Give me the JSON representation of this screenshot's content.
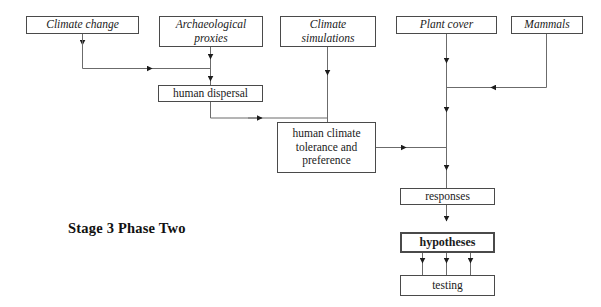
{
  "diagram": {
    "title_label": "Stage 3 Phase Two",
    "nodes": [
      {
        "id": "climate_change",
        "label": "Climate change"
      },
      {
        "id": "arch_proxies",
        "label": "Archaeological\nproxies"
      },
      {
        "id": "climate_sims",
        "label": "Climate\nsimulations"
      },
      {
        "id": "plant_cover",
        "label": "Plant cover"
      },
      {
        "id": "mammals",
        "label": "Mammals"
      },
      {
        "id": "human_dispersal",
        "label": "human dispersal"
      },
      {
        "id": "human_climate",
        "label": "human climate\ntolerance and\npreference"
      },
      {
        "id": "responses",
        "label": "responses"
      },
      {
        "id": "hypotheses",
        "label": "hypotheses"
      },
      {
        "id": "testing",
        "label": "testing"
      }
    ],
    "edges": [
      {
        "from": "climate_change",
        "to": "human_dispersal"
      },
      {
        "from": "arch_proxies",
        "to": "human_dispersal"
      },
      {
        "from": "human_dispersal",
        "to": "human_climate"
      },
      {
        "from": "climate_sims",
        "to": "human_climate"
      },
      {
        "from": "human_climate",
        "to": "responses_spine"
      },
      {
        "from": "plant_cover",
        "to": "responses"
      },
      {
        "from": "mammals",
        "to": "plant_cover_spine"
      },
      {
        "from": "responses",
        "to": "hypotheses"
      },
      {
        "from": "hypotheses",
        "to": "testing"
      },
      {
        "from": "hypotheses",
        "to": "testing"
      },
      {
        "from": "hypotheses",
        "to": "testing"
      }
    ],
    "colors": {
      "border": "#4a4a4a",
      "wire": "#6b6b6b",
      "arrow": "#1c1c1c",
      "text": "#1a1a1a",
      "background": "#ffffff"
    }
  }
}
